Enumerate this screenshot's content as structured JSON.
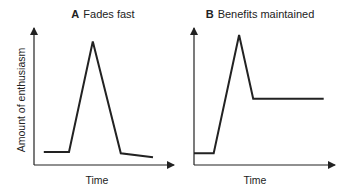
{
  "chart_data": [
    {
      "type": "line",
      "panel_letter": "A",
      "title": "Fades fast",
      "xlabel": "Time",
      "ylabel": "Amount of enthusiasm",
      "grid": false,
      "points": [
        {
          "x": 0.07,
          "y": 0.1
        },
        {
          "x": 0.25,
          "y": 0.1
        },
        {
          "x": 0.42,
          "y": 0.95
        },
        {
          "x": 0.62,
          "y": 0.09
        },
        {
          "x": 0.85,
          "y": 0.06
        }
      ]
    },
    {
      "type": "line",
      "panel_letter": "B",
      "title": "Benefits maintained",
      "xlabel": "Time",
      "ylabel": "",
      "grid": false,
      "points": [
        {
          "x": 0.0,
          "y": 0.09
        },
        {
          "x": 0.14,
          "y": 0.09
        },
        {
          "x": 0.32,
          "y": 1.0
        },
        {
          "x": 0.42,
          "y": 0.51
        },
        {
          "x": 0.92,
          "y": 0.51
        }
      ]
    }
  ]
}
